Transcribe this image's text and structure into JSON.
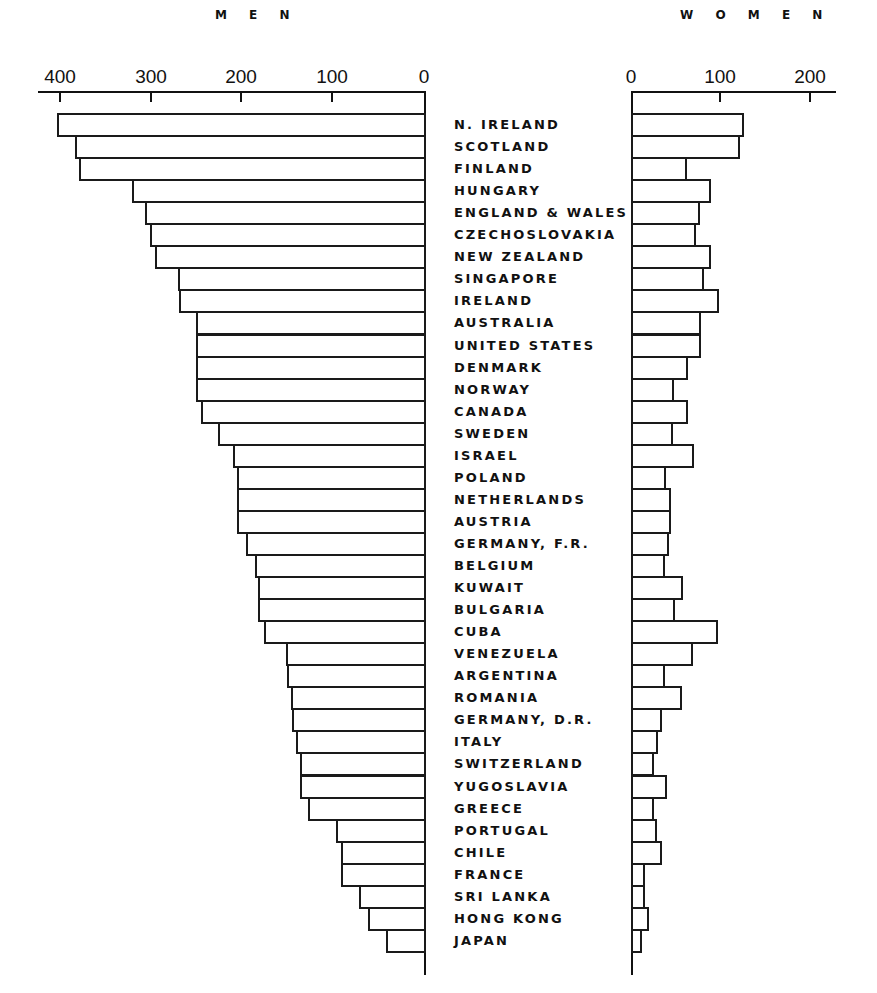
{
  "chart_data": {
    "type": "bar",
    "orientation": "horizontal",
    "layout": "back-to-back",
    "title": "",
    "panels": [
      {
        "name": "MEN",
        "axis_ticks": [
          400,
          300,
          200,
          100,
          0
        ],
        "xlim": [
          0,
          420
        ],
        "direction": "right-to-left"
      },
      {
        "name": "WOMEN",
        "axis_ticks": [
          0,
          100,
          200
        ],
        "xlim": [
          0,
          230
        ],
        "direction": "left-to-right"
      }
    ],
    "categories": [
      "N. IRELAND",
      "SCOTLAND",
      "FINLAND",
      "HUNGARY",
      "ENGLAND & WALES",
      "CZECHOSLOVAKIA",
      "NEW ZEALAND",
      "SINGAPORE",
      "IRELAND",
      "AUSTRALIA",
      "UNITED STATES",
      "DENMARK",
      "NORWAY",
      "CANADA",
      "SWEDEN",
      "ISRAEL",
      "POLAND",
      "NETHERLANDS",
      "AUSTRIA",
      "GERMANY, F.R.",
      "BELGIUM",
      "KUWAIT",
      "BULGARIA",
      "CUBA",
      "VENEZUELA",
      "ARGENTINA",
      "ROMANIA",
      "GERMANY, D.R.",
      "ITALY",
      "SWITZERLAND",
      "YUGOSLAVIA",
      "GREECE",
      "PORTUGAL",
      "CHILE",
      "FRANCE",
      "SRI LANKA",
      "HONG KONG",
      "JAPAN"
    ],
    "series": [
      {
        "name": "MEN",
        "values": [
          404,
          384,
          380,
          322,
          307,
          302,
          296,
          271,
          270,
          251,
          251,
          251,
          251,
          246,
          227,
          210,
          206,
          206,
          206,
          196,
          186,
          183,
          183,
          176,
          152,
          151,
          146,
          145,
          141,
          137,
          137,
          128,
          97,
          91,
          91,
          72,
          62,
          42
        ]
      },
      {
        "name": "WOMEN",
        "values": [
          124,
          120,
          60,
          87,
          75,
          70,
          87,
          79,
          96,
          76,
          76,
          62,
          46,
          62,
          45,
          68,
          37,
          43,
          43,
          40,
          36,
          56,
          47,
          95,
          67,
          36,
          55,
          32,
          28,
          23,
          38,
          24,
          27,
          32,
          13,
          13,
          18,
          10
        ]
      }
    ],
    "xlabel": "",
    "ylabel": "",
    "grid": false,
    "legend": "none"
  },
  "men_title": "M E N",
  "women_title": "W O M E N",
  "men_ticks": [
    {
      "v": 400,
      "x": 60
    },
    {
      "v": 300,
      "x": 151
    },
    {
      "v": 200,
      "x": 241
    },
    {
      "v": 100,
      "x": 332
    },
    {
      "v": 0,
      "x": 424
    }
  ],
  "women_ticks": [
    {
      "v": 0,
      "x": 631
    },
    {
      "v": 100,
      "x": 720
    },
    {
      "v": 200,
      "x": 810
    }
  ]
}
